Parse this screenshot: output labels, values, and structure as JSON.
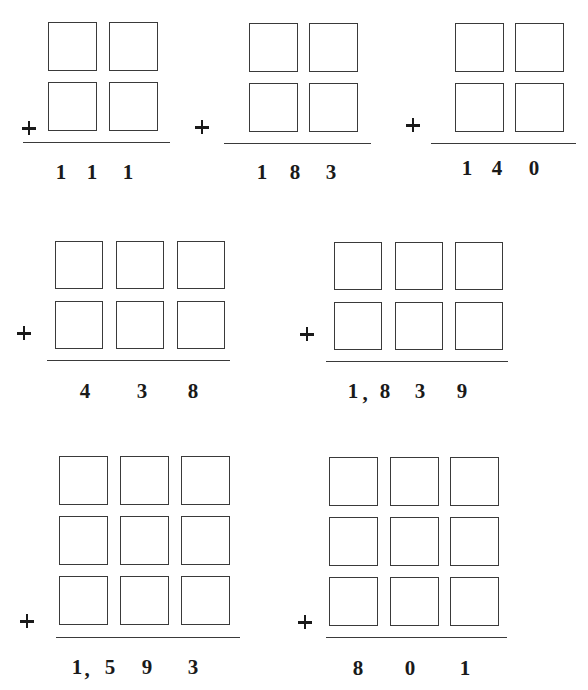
{
  "worksheet": {
    "operator_symbol": "+",
    "problems": [
      {
        "id": 1,
        "rows": 2,
        "cols": 2,
        "box_size": 49,
        "col_x": [
          48,
          109
        ],
        "row_y": [
          22,
          82
        ],
        "plus": [
          29,
          128
        ],
        "rule": {
          "x1": 23,
          "x2": 170,
          "y": 142
        },
        "answer": "111",
        "answer_glyphs": [
          {
            "text": "1",
            "x": 61,
            "y": 172
          },
          {
            "text": "1",
            "x": 92,
            "y": 172
          },
          {
            "text": "1",
            "x": 128,
            "y": 172
          }
        ]
      },
      {
        "id": 2,
        "rows": 2,
        "cols": 2,
        "box_size": 49,
        "col_x": [
          249,
          309
        ],
        "row_y": [
          23,
          83
        ],
        "plus": [
          202,
          127
        ],
        "rule": {
          "x1": 224,
          "x2": 371,
          "y": 143
        },
        "answer": "183",
        "answer_glyphs": [
          {
            "text": "1",
            "x": 262,
            "y": 172
          },
          {
            "text": "8",
            "x": 295,
            "y": 172
          },
          {
            "text": "3",
            "x": 331,
            "y": 172
          }
        ]
      },
      {
        "id": 3,
        "rows": 2,
        "cols": 2,
        "box_size": 49,
        "col_x": [
          455,
          515
        ],
        "row_y": [
          23,
          83
        ],
        "plus": [
          413,
          125
        ],
        "rule": {
          "x1": 431,
          "x2": 576,
          "y": 143
        },
        "answer": "140",
        "answer_glyphs": [
          {
            "text": "1",
            "x": 467,
            "y": 168
          },
          {
            "text": "4",
            "x": 497,
            "y": 168
          },
          {
            "text": "0",
            "x": 534,
            "y": 168
          }
        ]
      },
      {
        "id": 4,
        "rows": 2,
        "cols": 3,
        "box_size": 48,
        "col_x": [
          55,
          116,
          177
        ],
        "row_y": [
          241,
          301
        ],
        "plus": [
          24,
          333
        ],
        "rule": {
          "x1": 47,
          "x2": 230,
          "y": 360
        },
        "answer": "438",
        "answer_glyphs": [
          {
            "text": "4",
            "x": 85,
            "y": 391
          },
          {
            "text": "3",
            "x": 142,
            "y": 391
          },
          {
            "text": "8",
            "x": 193,
            "y": 391
          }
        ]
      },
      {
        "id": 5,
        "rows": 2,
        "cols": 3,
        "box_size": 48,
        "col_x": [
          334,
          395,
          455
        ],
        "row_y": [
          242,
          302
        ],
        "plus": [
          307,
          334
        ],
        "rule": {
          "x1": 326,
          "x2": 508,
          "y": 361
        },
        "answer": "1,839",
        "answer_glyphs": [
          {
            "text": "1",
            "x": 353,
            "y": 391
          },
          {
            "text": ",",
            "x": 365,
            "y": 393
          },
          {
            "text": "8",
            "x": 385,
            "y": 391
          },
          {
            "text": "3",
            "x": 420,
            "y": 391
          },
          {
            "text": "9",
            "x": 462,
            "y": 391
          }
        ]
      },
      {
        "id": 6,
        "rows": 3,
        "cols": 3,
        "box_size": 49,
        "col_x": [
          59,
          120,
          181
        ],
        "row_y": [
          456,
          516,
          576
        ],
        "plus": [
          27,
          621
        ],
        "rule": {
          "x1": 56,
          "x2": 240,
          "y": 637
        },
        "answer": "1,593",
        "answer_glyphs": [
          {
            "text": "1",
            "x": 77,
            "y": 667
          },
          {
            "text": ",",
            "x": 87,
            "y": 669
          },
          {
            "text": "5",
            "x": 110,
            "y": 667
          },
          {
            "text": "9",
            "x": 147,
            "y": 667
          },
          {
            "text": "3",
            "x": 193,
            "y": 667
          }
        ]
      },
      {
        "id": 7,
        "rows": 3,
        "cols": 3,
        "box_size": 49,
        "col_x": [
          329,
          390,
          450
        ],
        "row_y": [
          457,
          517,
          577
        ],
        "plus": [
          305,
          622
        ],
        "rule": {
          "x1": 326,
          "x2": 507,
          "y": 637
        },
        "answer": "801",
        "answer_glyphs": [
          {
            "text": "8",
            "x": 358,
            "y": 668
          },
          {
            "text": "0",
            "x": 410,
            "y": 668
          },
          {
            "text": "1",
            "x": 465,
            "y": 668
          }
        ]
      }
    ]
  }
}
